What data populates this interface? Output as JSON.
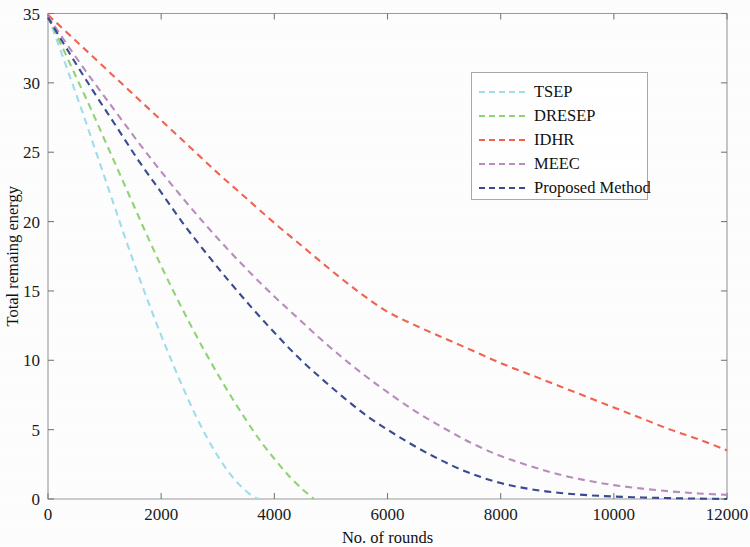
{
  "chart_data": {
    "type": "line",
    "title": "",
    "xlabel": "No. of rounds",
    "ylabel": "Total remaing energy",
    "xlim": [
      0,
      12000
    ],
    "ylim": [
      0,
      35
    ],
    "xticks": [
      0,
      2000,
      4000,
      6000,
      8000,
      10000,
      12000
    ],
    "xtick_labels": [
      "0",
      "2000",
      "4000",
      "6000",
      "8000",
      "10000",
      "12000"
    ],
    "yticks": [
      0,
      5,
      10,
      15,
      20,
      25,
      30,
      35
    ],
    "ytick_labels": [
      "0",
      "5",
      "10",
      "15",
      "20",
      "25",
      "30",
      "35"
    ],
    "grid": false,
    "legend_position": "upper right",
    "linestyle": "dashed",
    "series": [
      {
        "name": "TSEP",
        "color": "#9fdcec",
        "x": [
          0,
          200,
          400,
          600,
          800,
          1000,
          1200,
          1400,
          1600,
          1800,
          2000,
          2200,
          2400,
          2600,
          2800,
          3000,
          3200,
          3400,
          3600,
          3720
        ],
        "y": [
          34.8,
          32.6,
          30.3,
          28.0,
          25.6,
          23.2,
          20.8,
          18.4,
          16.1,
          13.9,
          11.8,
          9.8,
          7.9,
          6.1,
          4.5,
          3.1,
          1.9,
          0.95,
          0.25,
          0.0
        ]
      },
      {
        "name": "DRESEP",
        "color": "#8ed473",
        "x": [
          0,
          250,
          500,
          750,
          1000,
          1250,
          1500,
          1750,
          2000,
          2250,
          2500,
          2750,
          3000,
          3250,
          3500,
          3750,
          4000,
          4250,
          4500,
          4700
        ],
        "y": [
          34.8,
          32.6,
          30.4,
          28.2,
          25.9,
          23.6,
          21.3,
          19.0,
          16.8,
          14.7,
          12.7,
          10.8,
          9.0,
          7.3,
          5.7,
          4.2,
          2.9,
          1.7,
          0.7,
          0.0
        ]
      },
      {
        "name": "IDHR",
        "color": "#f1634f",
        "x": [
          0,
          500,
          1000,
          1500,
          2000,
          2500,
          3000,
          3500,
          4000,
          4500,
          5000,
          5500,
          6000,
          6500,
          7000,
          7500,
          8000,
          8500,
          9000,
          9500,
          10000,
          10500,
          11000,
          11500,
          12000
        ],
        "y": [
          34.9,
          33.0,
          31.1,
          29.2,
          27.3,
          25.4,
          23.5,
          21.7,
          19.9,
          18.2,
          16.5,
          14.9,
          13.5,
          12.5,
          11.6,
          10.7,
          9.8,
          9.0,
          8.2,
          7.4,
          6.6,
          5.8,
          5.0,
          4.3,
          3.5
        ]
      },
      {
        "name": "MEEC",
        "color": "#b98bbe",
        "x": [
          0,
          400,
          800,
          1200,
          1600,
          2000,
          2400,
          2800,
          3200,
          3600,
          4000,
          4400,
          4800,
          5200,
          5600,
          6000,
          6500,
          7000,
          7500,
          8000,
          8500,
          9000,
          9500,
          10000,
          10500,
          11000,
          11500,
          12000
        ],
        "y": [
          34.8,
          32.4,
          30.1,
          27.9,
          25.7,
          23.6,
          21.6,
          19.7,
          17.9,
          16.2,
          14.6,
          13.1,
          11.6,
          10.2,
          8.9,
          7.7,
          6.3,
          5.1,
          4.0,
          3.1,
          2.4,
          1.8,
          1.35,
          1.0,
          0.75,
          0.55,
          0.4,
          0.3
        ]
      },
      {
        "name": "Proposed Method",
        "color": "#3a4a90",
        "x": [
          0,
          400,
          800,
          1200,
          1600,
          2000,
          2400,
          2800,
          3200,
          3600,
          4000,
          4400,
          4800,
          5200,
          5600,
          6000,
          6400,
          6800,
          7200,
          7600,
          8000,
          8400,
          8800,
          9200,
          9600,
          10000,
          10500,
          11000,
          11500,
          12000
        ],
        "y": [
          34.7,
          32.0,
          29.4,
          26.9,
          24.4,
          22.1,
          19.8,
          17.7,
          15.7,
          13.8,
          12.0,
          10.3,
          8.8,
          7.4,
          6.1,
          5.0,
          4.0,
          3.1,
          2.3,
          1.65,
          1.15,
          0.8,
          0.55,
          0.38,
          0.26,
          0.18,
          0.11,
          0.06,
          0.03,
          0.0
        ]
      }
    ]
  },
  "legend": {
    "entries": [
      {
        "label": "TSEP"
      },
      {
        "label": "DRESEP"
      },
      {
        "label": "IDHR"
      },
      {
        "label": "MEEC"
      },
      {
        "label": "Proposed Method"
      }
    ]
  }
}
